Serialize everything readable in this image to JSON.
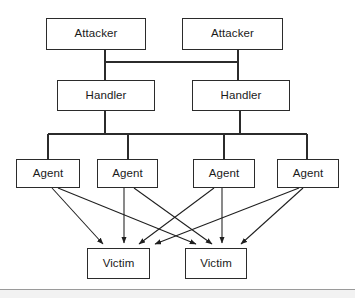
{
  "diagram": {
    "type": "hierarchy-tree",
    "background_color": "#ffffff",
    "line_color": "#2b2b2b",
    "text_color": "#1a1a1a",
    "tiers": [
      {
        "id": "attacker",
        "label": "Attacker tier",
        "nodes": [
          {
            "id": "attacker-1",
            "label": "Attacker",
            "x": 46,
            "y": 18,
            "w": 100,
            "h": 32
          },
          {
            "id": "attacker-2",
            "label": "Attacker",
            "x": 182,
            "y": 18,
            "w": 101,
            "h": 32
          }
        ]
      },
      {
        "id": "handler",
        "label": "Handler tier",
        "nodes": [
          {
            "id": "handler-1",
            "label": "Handler",
            "x": 57,
            "y": 80,
            "w": 98,
            "h": 31
          },
          {
            "id": "handler-2",
            "label": "Handler",
            "x": 192,
            "y": 80,
            "w": 98,
            "h": 31
          }
        ]
      },
      {
        "id": "agent",
        "label": "Agent tier",
        "nodes": [
          {
            "id": "agent-1",
            "label": "Agent",
            "x": 16,
            "y": 159,
            "w": 64,
            "h": 29
          },
          {
            "id": "agent-2",
            "label": "Agent",
            "x": 97,
            "y": 159,
            "w": 61,
            "h": 29
          },
          {
            "id": "agent-3",
            "label": "Agent",
            "x": 193,
            "y": 159,
            "w": 62,
            "h": 29
          },
          {
            "id": "agent-4",
            "label": "Agent",
            "x": 277,
            "y": 159,
            "w": 62,
            "h": 29
          }
        ]
      },
      {
        "id": "victim",
        "label": "Victim tier",
        "nodes": [
          {
            "id": "victim-1",
            "label": "Victim",
            "x": 87,
            "y": 248,
            "w": 63,
            "h": 31
          },
          {
            "id": "victim-2",
            "label": "Victim",
            "x": 185,
            "y": 248,
            "w": 62,
            "h": 31
          }
        ]
      }
    ],
    "connections": {
      "attacker_to_handler": [
        {
          "from": "attacker-1",
          "to": "handler-1",
          "style": "orthogonal-bus"
        },
        {
          "from": "attacker-1",
          "to": "handler-2",
          "style": "orthogonal-bus"
        },
        {
          "from": "attacker-2",
          "to": "handler-1",
          "style": "orthogonal-bus"
        },
        {
          "from": "attacker-2",
          "to": "handler-2",
          "style": "orthogonal-bus"
        }
      ],
      "handler_to_agent": [
        {
          "from": "handler-1",
          "to": "agent-1",
          "style": "orthogonal-bus"
        },
        {
          "from": "handler-1",
          "to": "agent-2",
          "style": "orthogonal-bus"
        },
        {
          "from": "handler-2",
          "to": "agent-3",
          "style": "orthogonal-bus"
        },
        {
          "from": "handler-2",
          "to": "agent-4",
          "style": "orthogonal-bus"
        }
      ],
      "agent_to_victim": [
        {
          "from": "agent-1",
          "to": "victim-1",
          "style": "arrow"
        },
        {
          "from": "agent-1",
          "to": "victim-2",
          "style": "arrow"
        },
        {
          "from": "agent-2",
          "to": "victim-1",
          "style": "arrow"
        },
        {
          "from": "agent-2",
          "to": "victim-2",
          "style": "arrow"
        },
        {
          "from": "agent-3",
          "to": "victim-1",
          "style": "arrow"
        },
        {
          "from": "agent-3",
          "to": "victim-2",
          "style": "arrow"
        },
        {
          "from": "agent-4",
          "to": "victim-1",
          "style": "arrow"
        },
        {
          "from": "agent-4",
          "to": "victim-2",
          "style": "arrow"
        }
      ]
    }
  }
}
